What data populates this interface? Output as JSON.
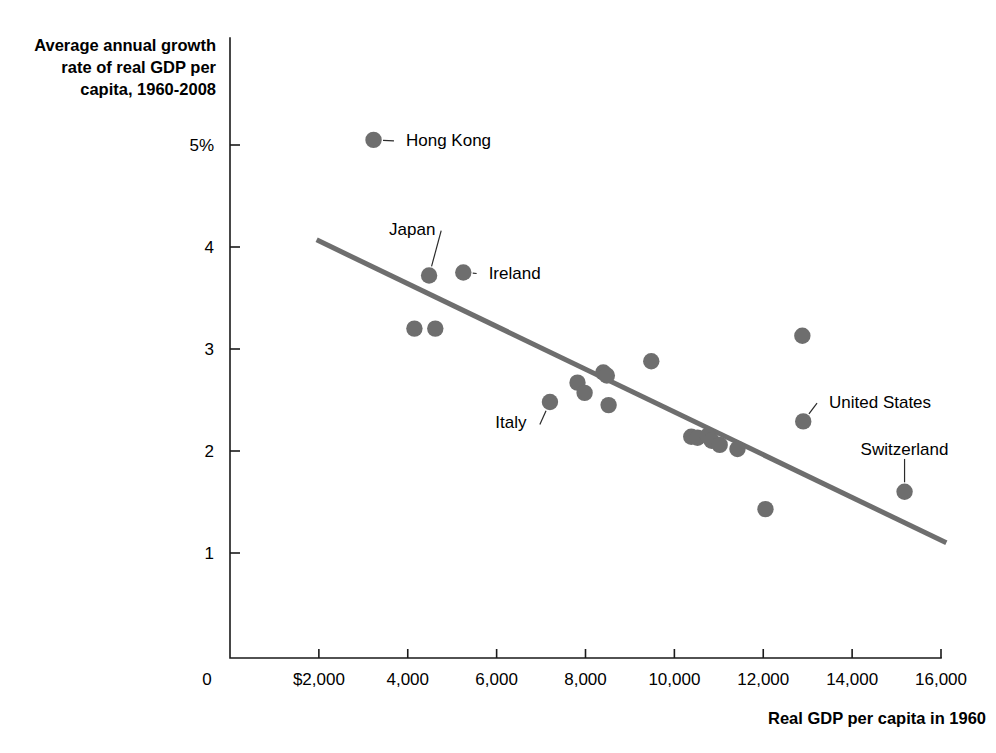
{
  "chart_data": {
    "type": "scatter",
    "title": "",
    "xlabel": "Real GDP per capita in 1960",
    "ylabel": "Average annual growth rate of real GDP per capita, 1960-2008",
    "xlim": [
      0,
      16000
    ],
    "ylim": [
      0,
      5.6
    ],
    "grid": false,
    "legend": "none",
    "marker_color": "#6e6e6e",
    "trendline_color": "#6e6e6e",
    "x_ticks": [
      {
        "value": 0,
        "label": "0"
      },
      {
        "value": 2000,
        "label": "$2,000"
      },
      {
        "value": 4000,
        "label": "4,000"
      },
      {
        "value": 6000,
        "label": "6,000"
      },
      {
        "value": 8000,
        "label": "8,000"
      },
      {
        "value": 10000,
        "label": "10,000"
      },
      {
        "value": 12000,
        "label": "12,000"
      },
      {
        "value": 14000,
        "label": "14,000"
      },
      {
        "value": 16000,
        "label": "16,000"
      }
    ],
    "y_ticks": [
      {
        "value": 5,
        "label": "5%"
      },
      {
        "value": 4,
        "label": "4"
      },
      {
        "value": 3,
        "label": "3"
      },
      {
        "value": 2,
        "label": "2"
      },
      {
        "value": 1,
        "label": "1"
      }
    ],
    "points": [
      {
        "x": 3230,
        "y": 5.05,
        "label": "Hong Kong"
      },
      {
        "x": 4480,
        "y": 3.72,
        "label": "Japan"
      },
      {
        "x": 5250,
        "y": 3.75,
        "label": "Ireland"
      },
      {
        "x": 4150,
        "y": 3.2,
        "label": ""
      },
      {
        "x": 4620,
        "y": 3.2,
        "label": ""
      },
      {
        "x": 12880,
        "y": 3.13,
        "label": ""
      },
      {
        "x": 9480,
        "y": 2.88,
        "label": ""
      },
      {
        "x": 8400,
        "y": 2.77,
        "label": ""
      },
      {
        "x": 8480,
        "y": 2.74,
        "label": ""
      },
      {
        "x": 7820,
        "y": 2.67,
        "label": ""
      },
      {
        "x": 7980,
        "y": 2.57,
        "label": ""
      },
      {
        "x": 7200,
        "y": 2.48,
        "label": "Italy"
      },
      {
        "x": 8520,
        "y": 2.45,
        "label": ""
      },
      {
        "x": 12900,
        "y": 2.29,
        "label": "United States"
      },
      {
        "x": 10380,
        "y": 2.14,
        "label": ""
      },
      {
        "x": 10520,
        "y": 2.13,
        "label": ""
      },
      {
        "x": 10750,
        "y": 2.15,
        "label": ""
      },
      {
        "x": 10840,
        "y": 2.1,
        "label": ""
      },
      {
        "x": 11020,
        "y": 2.06,
        "label": ""
      },
      {
        "x": 11420,
        "y": 2.02,
        "label": ""
      },
      {
        "x": 15180,
        "y": 1.6,
        "label": "Switzerland"
      },
      {
        "x": 12050,
        "y": 1.43,
        "label": ""
      }
    ],
    "trendline": {
      "x1": 1950,
      "y1": 4.07,
      "x2": 16120,
      "y2": 1.1
    },
    "annotations": [
      {
        "text": "Hong Kong",
        "point_x": 3230,
        "point_y": 5.05,
        "text_x": 3960,
        "text_y": 5.05,
        "anchor": "start",
        "leader": true
      },
      {
        "text": "Japan",
        "point_x": 4480,
        "point_y": 3.72,
        "text_x": 4100,
        "text_y": 4.18,
        "anchor": "middle",
        "leader": true
      },
      {
        "text": "Ireland",
        "point_x": 5250,
        "point_y": 3.75,
        "text_x": 5820,
        "text_y": 3.75,
        "anchor": "start",
        "leader": true
      },
      {
        "text": "Italy",
        "point_x": 7200,
        "point_y": 2.48,
        "text_x": 6320,
        "text_y": 2.28,
        "anchor": "middle",
        "leader": true
      },
      {
        "text": "United States",
        "point_x": 12900,
        "point_y": 2.29,
        "text_x": 13480,
        "text_y": 2.48,
        "anchor": "start",
        "leader": true
      },
      {
        "text": "Switzerland",
        "point_x": 15180,
        "point_y": 1.6,
        "text_x": 15180,
        "text_y": 2.02,
        "anchor": "middle",
        "leader": true
      }
    ]
  },
  "axes": {
    "y_title_lines": [
      "Average annual growth",
      "rate of real GDP per",
      "capita, 1960-2008"
    ],
    "x_title": "Real GDP per capita in 1960"
  }
}
